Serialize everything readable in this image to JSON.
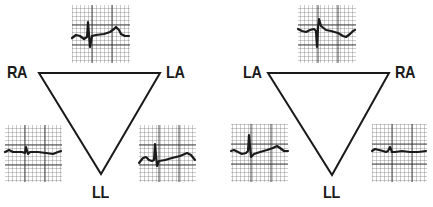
{
  "colors": {
    "ink": "#1a1a1a",
    "grid": "#555555",
    "background": "#ffffff"
  },
  "panels": [
    {
      "id": "normal",
      "labels": {
        "top_left": "RA",
        "top_right": "LA",
        "bottom": "LL"
      },
      "triangle": {
        "points": [
          [
            39,
            73
          ],
          [
            160,
            73
          ],
          [
            101,
            174
          ]
        ]
      },
      "strips": [
        {
          "position": "top",
          "lead": "I",
          "box": [
            72,
            5,
            58,
            58
          ],
          "trace": "M72,38 L76,35 L80,36 L84,39 L87,37 L88,22 L90,47 L92,36 L96,35 L104,34 L110,32 L114,29 L116,27 L119,30 L121,34 L125,36 L129,36"
        },
        {
          "position": "bottom-left",
          "lead": "III",
          "box": [
            5,
            125,
            57,
            57
          ],
          "trace": "M5,152 L9,150 L13,152 L18,152 L22,152 L25,153 L26,147 L28,154 L30,152 L38,152 L46,153 L53,154 L58,152 L61,151"
        },
        {
          "position": "bottom-right",
          "lead": "II",
          "box": [
            139,
            125,
            57,
            57
          ],
          "trace": "M139,163 L143,158 L146,157 L149,160 L152,161 L154,160 L155,144 L157,166 L159,161 L165,160 L172,158 L180,156 L187,153 L191,155 L195,160"
        }
      ]
    },
    {
      "id": "reversed",
      "labels": {
        "top_left": "LA",
        "top_right": "RA",
        "bottom": "LL"
      },
      "triangle": {
        "points": [
          [
            268,
            73
          ],
          [
            389,
            73
          ],
          [
            332,
            175
          ]
        ]
      },
      "strips": [
        {
          "position": "top",
          "lead": "I (inverted)",
          "box": [
            298,
            5,
            58,
            58
          ],
          "trace": "M298,29 L302,31 L306,32 L310,30 L314,29 L316,31 L317,47 L318,28 L319,19 L321,26 L326,30 L331,31 L338,33 L343,36 L346,37 L350,34 L353,31 L355,30"
        },
        {
          "position": "bottom-left",
          "lead": "III",
          "box": [
            231,
            124,
            57,
            58
          ],
          "trace": "M231,151 L234,150 L238,152 L242,154 L246,153 L248,151 L249,135 L251,157 L254,154 L260,152 L267,150 L273,148 L277,146 L280,148 L284,151 L288,151"
        },
        {
          "position": "bottom-right",
          "lead": "II",
          "box": [
            372,
            124,
            55,
            58
          ],
          "trace": "M372,151 L375,149 L379,150 L383,151 L386,152 L388,151 L390,147 L392,152 L395,152 L402,151 L410,152 L418,152 L426,151"
        }
      ]
    }
  ]
}
